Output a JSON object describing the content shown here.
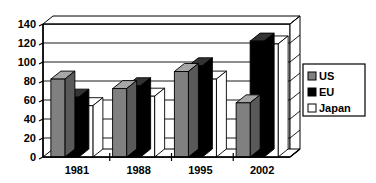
{
  "chart_data": {
    "type": "bar",
    "title": "",
    "subtitle": "",
    "xlabel": "",
    "ylabel": "",
    "categories": [
      "1981",
      "1988",
      "1995",
      "2002"
    ],
    "series": [
      {
        "name": "US",
        "values": [
          82,
          72,
          90,
          57
        ],
        "color": "#808080"
      },
      {
        "name": "EU",
        "values": [
          63,
          75,
          96,
          122
        ],
        "color": "#000000"
      },
      {
        "name": "Japan",
        "values": [
          54,
          64,
          82,
          119
        ],
        "color": "#ffffff"
      }
    ],
    "ylim": [
      0,
      140
    ],
    "yticks": [
      0,
      20,
      40,
      60,
      80,
      100,
      120,
      140
    ],
    "ytick_labels": [
      "0",
      "20",
      "40",
      "60",
      "80",
      "100",
      "120",
      "140"
    ],
    "grid": true,
    "grid_axis": "y",
    "legend_position": "right",
    "style_3d": true,
    "plot_background": "#ffffff",
    "axis_color": "#000000"
  },
  "legend": {
    "entries": [
      {
        "label": "US",
        "swatch": "#808080"
      },
      {
        "label": "EU",
        "swatch": "#000000"
      },
      {
        "label": "Japan",
        "swatch": "#ffffff"
      }
    ]
  },
  "axis": {
    "y_ticks": [
      "140",
      "120",
      "100",
      "80",
      "60",
      "40",
      "20",
      "0"
    ],
    "x_labels": [
      "1981",
      "1988",
      "1995",
      "2002"
    ]
  }
}
